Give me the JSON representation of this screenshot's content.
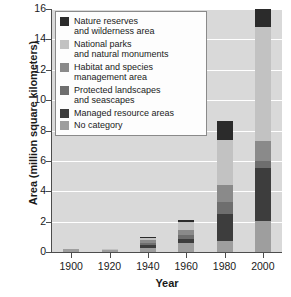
{
  "chart_data": {
    "type": "bar",
    "stacked": true,
    "title": "",
    "xlabel": "Year",
    "ylabel": "Area (million square kilometers)",
    "categories": [
      "1900",
      "1920",
      "1940",
      "1960",
      "1980",
      "2000"
    ],
    "ylim": [
      0,
      16
    ],
    "yticks": [
      "0",
      "2",
      "4",
      "6",
      "8",
      "10",
      "12",
      "14",
      "16"
    ],
    "grid": "horizontal-white",
    "legend_position": "upper-left-inside",
    "plot_background": "#d9d9d9",
    "series": [
      {
        "name": "No category",
        "color": "#9e9e9e",
        "values": [
          0.18,
          0.14,
          0.28,
          0.62,
          0.72,
          2.02
        ]
      },
      {
        "name": "Managed resource areas",
        "color": "#3d3d3d",
        "values": [
          0.0,
          0.0,
          0.18,
          0.22,
          1.78,
          3.48
        ]
      },
      {
        "name": "Protected landscapes and seascapes",
        "color": "#6e6e6e",
        "values": [
          0.0,
          0.0,
          0.14,
          0.26,
          0.82,
          0.52
        ]
      },
      {
        "name": "Habitat and species management area",
        "color": "#8a8a8a",
        "values": [
          0.0,
          0.0,
          0.16,
          0.38,
          1.12,
          1.26
        ]
      },
      {
        "name": "National parks and natural monuments",
        "color": "#c2c2c2",
        "values": [
          0.0,
          0.02,
          0.18,
          0.48,
          2.96,
          7.52
        ]
      },
      {
        "name": "Nature reserves and wilderness area",
        "color": "#2b2b2b",
        "values": [
          0.0,
          0.0,
          0.06,
          0.14,
          1.2,
          1.6
        ]
      }
    ],
    "totals": [
      0.18,
      0.16,
      1.0,
      2.1,
      8.6,
      16.4
    ]
  },
  "legend": {
    "items": [
      {
        "label": "Nature reserves\nand wilderness area",
        "color": "#2b2b2b"
      },
      {
        "label": "National parks\nand natural monuments",
        "color": "#c2c2c2"
      },
      {
        "label": "Habitat and species\nmanagement area",
        "color": "#8a8a8a"
      },
      {
        "label": "Protected landscapes\nand seascapes",
        "color": "#6e6e6e"
      },
      {
        "label": "Managed resource areas",
        "color": "#3d3d3d"
      },
      {
        "label": "No category",
        "color": "#9e9e9e"
      }
    ]
  }
}
